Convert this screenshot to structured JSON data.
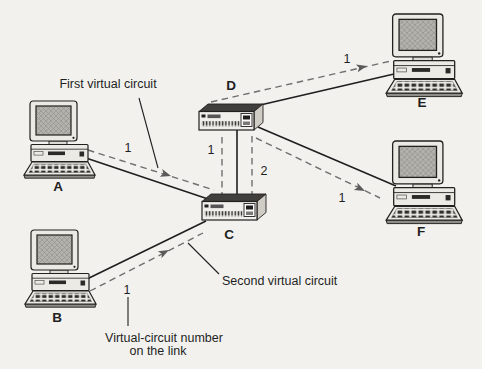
{
  "diagram": {
    "type": "network-virtual-circuit-diagram",
    "nodes": {
      "A": {
        "label": "A",
        "kind": "host"
      },
      "B": {
        "label": "B",
        "kind": "host"
      },
      "C": {
        "label": "C",
        "kind": "packet-switch"
      },
      "D": {
        "label": "D",
        "kind": "packet-switch"
      },
      "E": {
        "label": "E",
        "kind": "host"
      },
      "F": {
        "label": "F",
        "kind": "host"
      }
    },
    "links": [
      "A-C",
      "B-C",
      "C-D",
      "D-E",
      "D-F"
    ],
    "virtual_circuits": {
      "first": {
        "annotation": "First virtual circuit",
        "route": "A-C-D-E",
        "numbers": {
          "link_ac": "1",
          "link_cd": "1",
          "link_de": "1"
        }
      },
      "second": {
        "annotation": "Second virtual circuit",
        "route": "B-C-D-F",
        "numbers": {
          "link_bc": "1",
          "link_cd": "2",
          "link_df": "1"
        }
      }
    },
    "caption": {
      "line1": "Virtual-circuit number",
      "line2": "on the link"
    }
  },
  "colors": {
    "background": "#f2f1ee",
    "ink": "#1f1f1f",
    "dashed": "#6f6f6f"
  }
}
